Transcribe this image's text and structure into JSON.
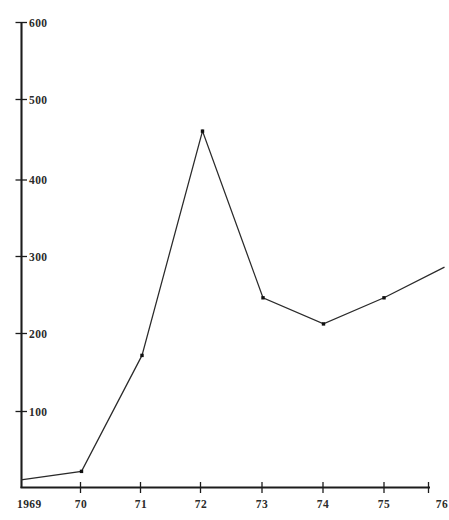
{
  "chart_data": {
    "type": "line",
    "title": "",
    "subtitle": "",
    "xlabel": "",
    "ylabel": "",
    "grid": false,
    "legend": null,
    "x_tick_labels": [
      "1969",
      "70",
      "71",
      "72",
      "73",
      "74",
      "75",
      "76"
    ],
    "x_values": [
      1969,
      1970,
      1971,
      1972,
      1973,
      1974,
      1975,
      1976
    ],
    "xlim": [
      1969,
      1976.1
    ],
    "y_tick_labels": [
      "100",
      "200",
      "300",
      "400",
      "500",
      "600"
    ],
    "y_ticks": [
      100,
      200,
      300,
      400,
      500,
      600
    ],
    "ylim": [
      0,
      620
    ],
    "series": [
      {
        "name": "series-1",
        "values": [
          10,
          21,
          172,
          464,
          247,
          213,
          247,
          287
        ],
        "marker": "square",
        "color": "#202020"
      }
    ],
    "notes": {
      "right_edge_clipped": "true",
      "last_x_label_partially_cut": "76"
    }
  },
  "axes": {
    "y_axis_name": "vertical-axis",
    "x_axis_name": "horizontal-axis",
    "origin_label": "1969"
  },
  "colors": {
    "axis": "#1c1c1c",
    "line": "#2a2a2a",
    "marker": "#101010",
    "background": "#ffffff",
    "text": "#2b2b2b"
  }
}
